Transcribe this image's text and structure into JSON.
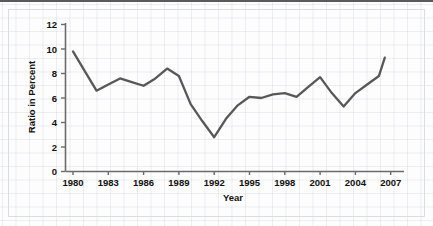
{
  "chart_data": {
    "type": "line",
    "title": "",
    "xlabel": "Year",
    "ylabel": "Ratio in Percent",
    "xlim": [
      1979,
      2007.5
    ],
    "ylim": [
      0,
      12
    ],
    "ytick_step": 2,
    "yticks": [
      "0",
      "2",
      "4",
      "6",
      "8",
      "10",
      "12"
    ],
    "xticks": [
      "1980",
      "1983",
      "1986",
      "1989",
      "1992",
      "1995",
      "1998",
      "2001",
      "2004",
      "2007"
    ],
    "grid": "faint-background-grid",
    "legend": "none",
    "line_color": "#585858",
    "x": [
      1980,
      1981,
      1982,
      1983,
      1984,
      1985,
      1986,
      1987,
      1988,
      1989,
      1990,
      1991,
      1992,
      1993,
      1994,
      1995,
      1996,
      1997,
      1998,
      1999,
      2000,
      2001,
      2002,
      2003,
      2004,
      2005,
      2006
    ],
    "values": [
      9.8,
      8.2,
      6.6,
      7.1,
      7.6,
      7.3,
      7.0,
      7.6,
      8.4,
      7.8,
      5.5,
      4.1,
      2.8,
      4.3,
      5.4,
      6.1,
      6.0,
      6.3,
      6.4,
      6.1,
      6.9,
      7.7,
      6.4,
      5.3,
      6.4,
      7.1,
      7.8
    ],
    "series": [
      {
        "name": "Ratio in Percent",
        "values": [
          9.8,
          8.2,
          6.6,
          7.1,
          7.6,
          7.3,
          7.0,
          7.6,
          8.4,
          7.8,
          5.5,
          4.1,
          2.8,
          4.3,
          5.4,
          6.1,
          6.0,
          6.3,
          6.4,
          6.1,
          6.9,
          7.7,
          6.4,
          5.3,
          6.4,
          7.1,
          7.8
        ]
      }
    ],
    "final_point": {
      "x": 2006.5,
      "y": 9.3
    }
  },
  "axes": {
    "x_title": "Year",
    "y_title": "Ratio in Percent"
  }
}
